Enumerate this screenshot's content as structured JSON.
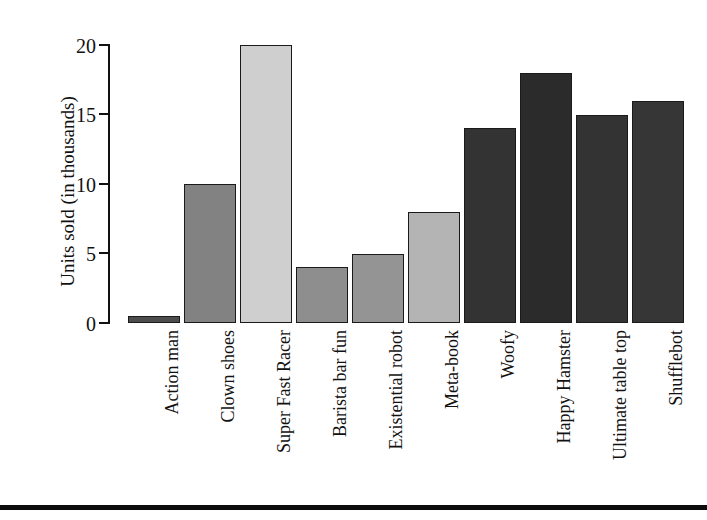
{
  "chart_data": {
    "type": "bar",
    "title": "",
    "xlabel": "",
    "ylabel": "Units sold (in thousands)",
    "ylim": [
      0,
      20
    ],
    "yticks": [
      0,
      5,
      10,
      15,
      20
    ],
    "ytick_labels": [
      "0",
      "5",
      "10",
      "15",
      "20"
    ],
    "grid": false,
    "legend": false,
    "orientation": "vertical",
    "xtick_label_rotation": 90,
    "categories": [
      "Action man",
      "Clown shoes",
      "Super Fast Racer",
      "Barista bar fun",
      "Existential robot",
      "Meta-book",
      "Woofy",
      "Happy Hamster",
      "Ultimate table top",
      "Shufflebot"
    ],
    "values": [
      0.5,
      10,
      20,
      4,
      5,
      8,
      14,
      18,
      15,
      16
    ],
    "bar_colors": [
      "#4d4d4d",
      "#828282",
      "#cfcfcf",
      "#8e8e8e",
      "#949494",
      "#b4b4b4",
      "#333333",
      "#2b2b2b",
      "#333333",
      "#363636"
    ],
    "bar_edge_color": "#1a1a1a"
  },
  "axis": {
    "y_title": "Units sold (in thousands)",
    "tick_labels": [
      "20",
      "15",
      "10",
      "5",
      "0"
    ],
    "spine_color": "#111111"
  },
  "footer": {
    "rule_color": "#0c0c0c"
  }
}
